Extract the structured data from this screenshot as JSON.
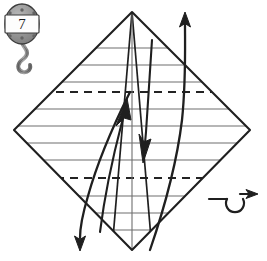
{
  "figure": {
    "kind": "origami-folding-diagram",
    "background_color": "#ffffff",
    "ink_color": "#1f1f1f",
    "crease_color": "#6e6e6e",
    "badge_fill": "#8e8e8e",
    "badge_stroke": "#3a3a3a",
    "badge_plate_fill": "#fefefe",
    "width": 267,
    "height": 261
  },
  "step_badge": {
    "name": "step-number-badge",
    "number": "7",
    "shape": "oval-tag-with-hook",
    "center_x": 22,
    "center_y": 24,
    "radius_x": 17,
    "radius_y": 20
  },
  "paper": {
    "name": "folded-paper-outline",
    "shape": "diamond",
    "vertices": {
      "top": {
        "x": 132,
        "y": 12
      },
      "right": {
        "x": 250,
        "y": 130
      },
      "bottom": {
        "x": 132,
        "y": 250
      },
      "left": {
        "x": 14,
        "y": 130
      }
    }
  },
  "creases": {
    "name": "crease-line-set",
    "solid_horizontal_y": [
      48,
      65,
      82,
      109,
      126,
      143,
      160,
      196,
      213,
      230
    ],
    "dashed_horizontal_y": [
      92,
      178
    ],
    "dash_pattern": "8 6",
    "solid_width": 1.1,
    "dashed_width": 1.8
  },
  "interior_folds": {
    "name": "interior-fold-lines",
    "description": "Lines radiating from the top and bottom vertices of the diamond",
    "from_top": [
      {
        "x1": 132,
        "y1": 12,
        "x2": 112,
        "y2": 250
      },
      {
        "x1": 132,
        "y1": 12,
        "x2": 152,
        "y2": 250
      },
      {
        "x1": 132,
        "y1": 12,
        "x2": 132,
        "y2": 250
      }
    ]
  },
  "arrows": [
    {
      "name": "fold-arrow-up-right",
      "direction": "up",
      "description": "Curved arrow sweeping up through the right half of the paper",
      "head_at": {
        "x": 185,
        "y": 15
      }
    },
    {
      "name": "fold-arrow-down-left",
      "direction": "down",
      "description": "Curved arrow sweeping down through the lower left of the paper",
      "head_at": {
        "x": 80,
        "y": 248
      }
    },
    {
      "name": "inner-fold-arrow-left",
      "direction": "up",
      "description": "Short inner curved arrow pointing up toward the center",
      "head_at": {
        "x": 124,
        "y": 100
      }
    },
    {
      "name": "inner-fold-arrow-right",
      "direction": "down",
      "description": "Short inner curved arrow pointing down toward the center",
      "head_at": {
        "x": 145,
        "y": 158
      }
    }
  ],
  "turn_over_symbol": {
    "name": "turn-over-symbol",
    "label": "turn over",
    "x": 212,
    "y": 200,
    "loop_center": {
      "x": 235,
      "y": 205
    },
    "loop_radius": 9
  }
}
